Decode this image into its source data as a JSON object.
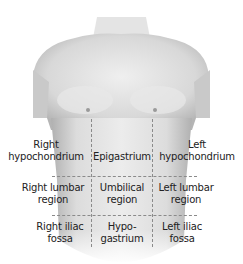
{
  "figure": {
    "regions": [
      {
        "id": "right-hypochondrium",
        "label": "Right\nhypochondrium",
        "line1": "Right",
        "line2": "hypochondrium"
      },
      {
        "id": "epigastrium",
        "label": "Epigastrium",
        "line1": "Epigastrium",
        "line2": ""
      },
      {
        "id": "left-hypochondrium",
        "label": "Left\nhypochondrium",
        "line1": "Left",
        "line2": "hypochondrium"
      },
      {
        "id": "right-lumbar",
        "label": "Right lumbar\nregion",
        "line1": "Right lumbar",
        "line2": "region"
      },
      {
        "id": "umbilical",
        "label": "Umbilical\nregion",
        "line1": "Umbilical",
        "line2": "region"
      },
      {
        "id": "left-lumbar",
        "label": "Left lumbar\nregion",
        "line1": "Left lumbar",
        "line2": "region"
      },
      {
        "id": "right-iliac-fossa",
        "label": "Right iliac\nfossa",
        "line1": "Right iliac",
        "line2": "fossa"
      },
      {
        "id": "hypogastrium",
        "label": "Hypo-\ngastrium",
        "line1": "Hypo-",
        "line2": "gastrium"
      },
      {
        "id": "left-iliac-fossa",
        "label": "Left iliac\nfossa",
        "line1": "Left iliac",
        "line2": "fossa"
      }
    ],
    "colors": {
      "skin_light": "#f2f2f2",
      "skin_mid": "#d9d9d9",
      "skin_dark": "#a8a8a8",
      "line": "#8a8a8a",
      "text": "#222222"
    }
  }
}
